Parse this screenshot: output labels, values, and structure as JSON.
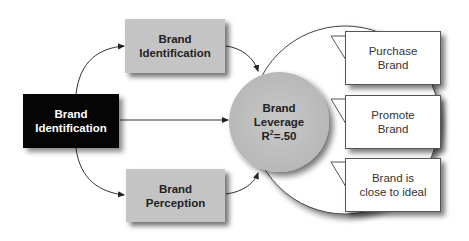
{
  "diagram": {
    "source_node": {
      "line1": "Brand",
      "line2": "Identification",
      "fill": "#050505"
    },
    "top_node": {
      "line1": "Brand",
      "line2": "Identification",
      "fill": "#c4c4c4"
    },
    "bottom_node": {
      "line1": "Brand",
      "line2": "Perception",
      "fill": "#c4c4c4"
    },
    "center_node": {
      "line1": "Brand",
      "line2": "Leverage",
      "r_label": "R",
      "r_exp": "2",
      "r_value": "=.50",
      "fill": "#c2c2c2"
    },
    "outcomes": [
      {
        "line1": "Purchase",
        "line2": "Brand"
      },
      {
        "line1": "Promote",
        "line2": "Brand"
      },
      {
        "line1": "Brand is",
        "line2": "close to ideal"
      }
    ]
  }
}
